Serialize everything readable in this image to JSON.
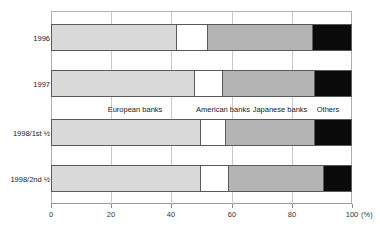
{
  "chart_data": {
    "type": "bar",
    "subtype": "stacked-horizontal-100pct",
    "title": "",
    "xlabel": "(%)",
    "ylabel": "",
    "xlim": [
      0,
      100
    ],
    "xticks": [
      0,
      20,
      40,
      60,
      80,
      100
    ],
    "xticklabels": [
      "0",
      "20",
      "40",
      "60",
      "80",
      "100"
    ],
    "unit": "(%)",
    "grid": true,
    "grid_axis": "x",
    "legend_position": "inline-center",
    "categories": [
      "1996",
      "1997",
      "1998/1st ½",
      "1998/2nd ½"
    ],
    "series": [
      {
        "name": "European banks",
        "color": "#d9d9d9",
        "values": [
          42,
          48,
          50,
          50
        ]
      },
      {
        "name": "American banks",
        "color": "#ffffff",
        "values": [
          10,
          9,
          8,
          9
        ]
      },
      {
        "name": "Japanese banks",
        "color": "#b4b4b4",
        "values": [
          35,
          31,
          30,
          32
        ]
      },
      {
        "name": "Others",
        "color": "#0a0a0a",
        "values": [
          13,
          12,
          12,
          9
        ]
      }
    ],
    "legend_label_positions_pct": [
      28,
      57,
      76,
      92
    ]
  },
  "axis": {
    "unit_label": "(%)"
  }
}
